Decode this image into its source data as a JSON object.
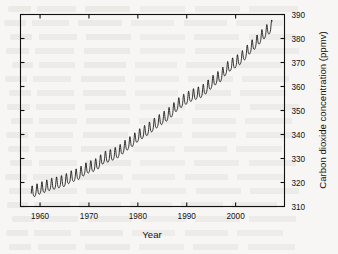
{
  "figure": {
    "background_color": "#f7f6f4",
    "ink_color": "#111111"
  },
  "chart_data": {
    "type": "line",
    "title": "",
    "xlabel": "Year",
    "ylabel": "Carbon dioxide concentration (ppmv)",
    "xlim": [
      1956,
      2010
    ],
    "ylim": [
      310,
      390
    ],
    "xticks": [
      1960,
      1970,
      1980,
      1990,
      2000
    ],
    "xtick_labels": [
      "1960",
      "1970",
      "1980",
      "1990",
      "2000"
    ],
    "yticks": [
      310,
      320,
      330,
      340,
      350,
      360,
      370,
      380,
      390
    ],
    "ytick_labels": [
      "310",
      "320",
      "330",
      "340",
      "350",
      "360",
      "370",
      "380",
      "390"
    ],
    "y_axis_position": "right",
    "x_axis_position": "bottom",
    "grid": false,
    "legend": null,
    "series_name": "Mauna Loa atmospheric CO2 (monthly mean)",
    "annotation": "Seasonal sawtooth oscillation superimposed on a rising trend",
    "seasonal_amplitude_ppmv": 3.0,
    "x": [
      1958.2,
      1959.0,
      1960.0,
      1961.0,
      1962.0,
      1963.0,
      1964.0,
      1965.0,
      1966.0,
      1967.0,
      1968.0,
      1969.0,
      1970.0,
      1971.0,
      1972.0,
      1973.0,
      1974.0,
      1975.0,
      1976.0,
      1977.0,
      1978.0,
      1979.0,
      1980.0,
      1981.0,
      1982.0,
      1983.0,
      1984.0,
      1985.0,
      1986.0,
      1987.0,
      1988.0,
      1989.0,
      1990.0,
      1991.0,
      1992.0,
      1993.0,
      1994.0,
      1995.0,
      1996.0,
      1997.0,
      1998.0,
      1999.0,
      2000.0,
      2001.0,
      2002.0,
      2003.0,
      2004.0,
      2005.0,
      2006.0,
      2007.0
    ],
    "values": [
      315.3,
      315.9,
      316.9,
      317.6,
      318.4,
      318.9,
      319.5,
      320.0,
      321.4,
      322.2,
      323.0,
      324.6,
      325.7,
      326.3,
      327.5,
      329.7,
      330.2,
      331.1,
      332.0,
      333.8,
      335.4,
      336.8,
      338.7,
      340.1,
      341.4,
      343.0,
      344.6,
      346.0,
      347.4,
      349.2,
      351.6,
      353.1,
      354.4,
      355.6,
      356.4,
      357.1,
      358.8,
      360.8,
      362.6,
      363.8,
      366.6,
      368.3,
      369.5,
      371.0,
      373.1,
      375.6,
      377.4,
      379.7,
      381.9,
      383.8
    ],
    "values_label": "annual mean CO2 (ppmv)",
    "data_start": "1958",
    "data_end": "2007",
    "y_start_value": 315.3,
    "y_end_value": 383.8
  },
  "axis": {
    "x_title": "Year",
    "y_title": "Carbon dioxide concentration (ppmv)"
  }
}
